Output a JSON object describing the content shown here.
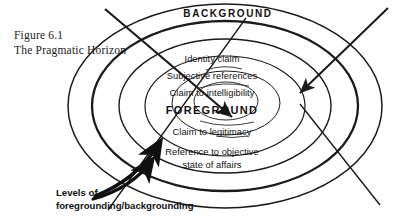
{
  "figure": {
    "caption_lines": [
      "Figure 6.1",
      "The Pragmatic Horizon"
    ],
    "outer_label": "BACKGROUND",
    "center_label": "FOREGROUND",
    "ring_labels": [
      "Identity claim",
      "Subjective references",
      "Claim to intelligibility",
      "Claim to legitimacy",
      "Reference to objective",
      "state of affairs"
    ],
    "annotation_lines": [
      "Levels of",
      "foregrounding/backgrounding"
    ],
    "colors": {
      "ink": "#111111",
      "line": "#1a1a1a",
      "background": "#ffffff"
    }
  }
}
